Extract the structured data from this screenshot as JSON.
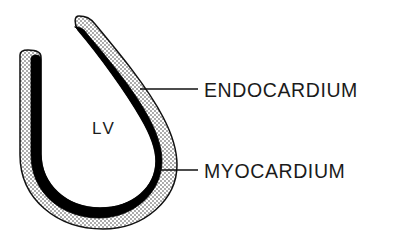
{
  "figure": {
    "type": "anatomical-diagram",
    "background_color": "#ffffff",
    "ink_color": "#111111"
  },
  "cavity": {
    "label": "LV",
    "name": "left-ventricle-cavity",
    "fill_color": "#ffffff",
    "x": 104,
    "y": 130
  },
  "layers": [
    {
      "key": "endocardium",
      "label": "ENDOCARDIUM",
      "fill_style": "solid-black",
      "fill_color": "#000000",
      "label_x": 204,
      "label_y": 97,
      "leader_from_x": 140,
      "leader_from_y": 89,
      "leader_to_x": 198,
      "leader_to_y": 89
    },
    {
      "key": "myocardium",
      "label": "MYOCARDIUM",
      "fill_style": "stipple-dots",
      "fill_color": "#ffffff",
      "stipple_color": "#2a2a2a",
      "label_x": 204,
      "label_y": 178,
      "leader_from_x": 159,
      "leader_from_y": 170,
      "leader_to_x": 198,
      "leader_to_y": 170
    }
  ],
  "geometry": {
    "outer_outline_path": "M 78 17 L 91 19 C 131 56 175 105 175 146 C 175 196 143 228 101 228 C 57 228 21 195 21 147 L 21 54 L 40 53 L 40 148 C 40 182 64 206 98 206 C 131 206 155 183 155 148 C 155 113 116 62 78 17 Z",
    "endocardium_band_path": "M 78 17 L 91 19 C 131 56 175 105 175 146 C 175 196 143 228 101 228 C 57 228 21 195 21 147 L 21 54 L 40 53 L 40 148 C 40 182 64 206 98 206 C 131 206 155 183 155 148 C 155 113 116 62 78 17 Z"
  },
  "colors": {
    "black": "#000000",
    "outline": "#111111",
    "white": "#ffffff",
    "stipple": "#2d2d2d"
  }
}
